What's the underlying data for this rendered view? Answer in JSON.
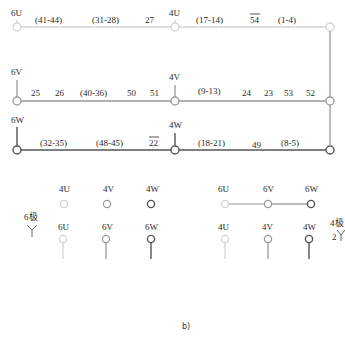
{
  "colors": {
    "U": "#d4d4d4",
    "V": "#9a9a9a",
    "W": "#555555"
  },
  "rows": {
    "U": {
      "left_terminal": "6U",
      "mid_terminal": "4U",
      "left_segments": [
        "(41-44)",
        "(31-28)",
        "27"
      ],
      "right_segments": [
        "(17-14)",
        "54",
        "(1-4)"
      ]
    },
    "V": {
      "left_terminal": "6V",
      "mid_terminal": "4V",
      "left_segments": [
        "25",
        "26",
        "(40-36)",
        "50",
        "51"
      ],
      "right_segments": [
        "(9-13)",
        "24",
        "23",
        "53",
        "52"
      ]
    },
    "W": {
      "left_terminal": "6W",
      "mid_terminal": "4W",
      "left_segments": [
        "(32-35)",
        "(48-45)",
        "22"
      ],
      "right_segments": [
        "(18-21)",
        "49",
        "(8-5)"
      ]
    }
  },
  "overlined": [
    "54",
    "22"
  ],
  "legend_6pole": {
    "label": "6极",
    "connection_symbol": "Y",
    "top_row": [
      "4U",
      "4V",
      "4W"
    ],
    "bottom_row": [
      "6U",
      "6V",
      "6W"
    ]
  },
  "legend_4pole": {
    "label": "4极",
    "connection_prefix": "2",
    "connection_symbol": "Y",
    "top_row": [
      "6U",
      "6V",
      "6W"
    ],
    "bottom_row": [
      "4U",
      "4V",
      "4W"
    ]
  },
  "caption": "b)"
}
